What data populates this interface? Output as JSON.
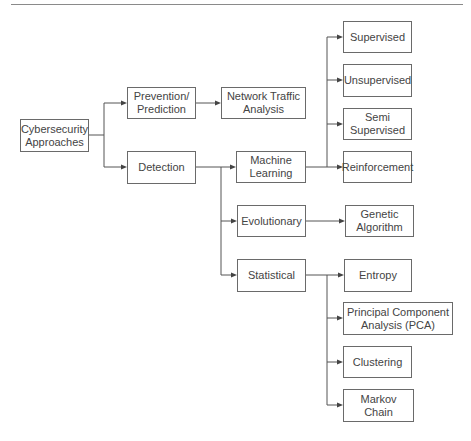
{
  "diagram": {
    "type": "hierarchy",
    "root": {
      "label": "Cybersecurity\nApproaches",
      "children": [
        {
          "label": "Prevention/\nPrediction",
          "children": [
            {
              "label": "Network Traffic\nAnalysis"
            }
          ]
        },
        {
          "label": "Detection",
          "children": [
            {
              "label": "Machine\nLearning",
              "children": [
                {
                  "label": "Supervised"
                },
                {
                  "label": "Unsupervised"
                },
                {
                  "label": "Semi\nSupervised"
                },
                {
                  "label": "Reinforcement"
                }
              ]
            },
            {
              "label": "Evolutionary",
              "children": [
                {
                  "label": "Genetic\nAlgorithm"
                }
              ]
            },
            {
              "label": "Statistical",
              "children": [
                {
                  "label": "Entropy"
                },
                {
                  "label": "Principal Component\nAnalysis (PCA)"
                },
                {
                  "label": "Clustering"
                },
                {
                  "label": "Markov  Chain"
                }
              ]
            }
          ]
        }
      ]
    }
  },
  "nodes": {
    "cyber": "Cybersecurity\nApproaches",
    "prevention": "Prevention/\nPrediction",
    "detection": "Detection",
    "network": "Network Traffic\nAnalysis",
    "ml": "Machine\nLearning",
    "evolutionary": "Evolutionary",
    "statistical": "Statistical",
    "supervised": "Supervised",
    "unsupervised": "Unsupervised",
    "semi": "Semi\nSupervised",
    "reinforcement": "Reinforcement",
    "genetic": "Genetic\nAlgorithm",
    "entropy": "Entropy",
    "pca": "Principal Component\nAnalysis (PCA)",
    "clustering": "Clustering",
    "markov": "Markov  Chain"
  },
  "colors": {
    "line": "#555555",
    "border": "#6a6a6a",
    "text": "#444444",
    "background": "#ffffff"
  }
}
